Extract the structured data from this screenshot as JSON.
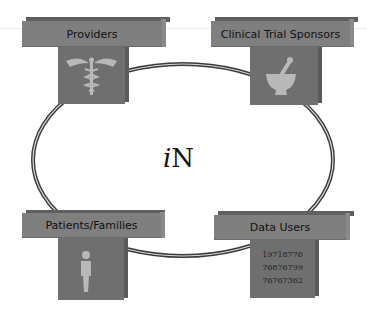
{
  "center_label": {
    "italic": "i",
    "text": "N"
  },
  "nodes": {
    "providers": {
      "label": "Providers",
      "icon": "caduceus-icon"
    },
    "sponsors": {
      "label": "Clinical Trial Sponsors",
      "icon": "mortar-pestle-icon"
    },
    "patients": {
      "label": "Patients/Families",
      "icon": "person-icon"
    },
    "data_users": {
      "label": "Data Users",
      "numbers": [
        "19718776",
        "76876799",
        "76767362"
      ]
    }
  },
  "colors": {
    "bar": "#7f7f7f",
    "box": "#6f6f6f",
    "icon": "#b8b8b8",
    "ring": "#444444"
  }
}
